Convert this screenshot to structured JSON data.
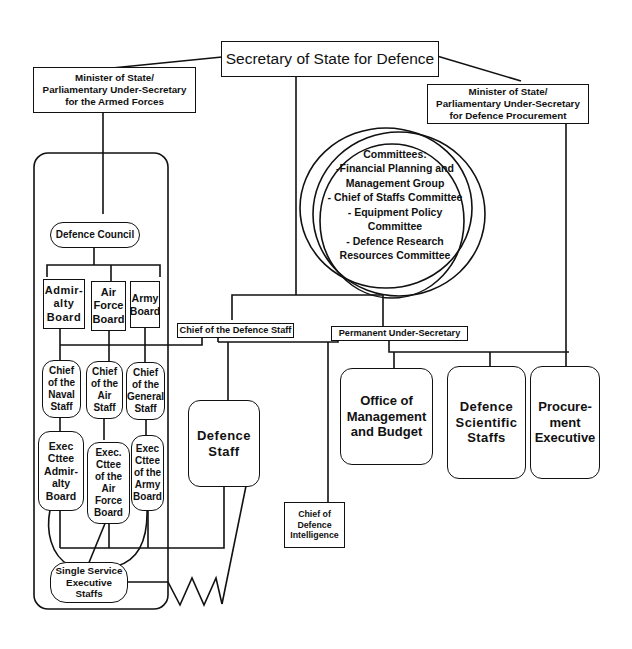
{
  "diagram": {
    "nodes": {
      "secretary": "Secretary of State for Defence",
      "minister_armed_forces": "Minister of State/\nParliamentary Under-Secretary\nfor the Armed Forces",
      "minister_procurement": "Minister of State/\nParliamentary Under-Secretary\nfor Defence Procurement",
      "committees": "Committees:\n-Financial Planning and\nManagement Group\n- Chief of Staffs  Committee\n- Equipment Policy Committee\n- Defence Research\nResources Committee",
      "defence_council": "Defence Council",
      "admiralty_board": "Admir-\nalty\nBoard",
      "air_force_board": "Air\nForce\nBoard",
      "army_board": "Army\nBoard",
      "chief_naval_staff": "Chief\nof the\nNaval\nStaff",
      "chief_air_staff": "Chief\nof the\nAir\nStaff",
      "chief_general_staff": "Chief\nof the\nGeneral\nStaff",
      "exec_admiralty": "Exec\nCttee\nAdmir-\nalty\nBoard",
      "exec_air_force": "Exec.\nCttee\nof the\nAir\nForce\nBoard",
      "exec_army": "Exec\nCttee\nof the\nArmy\nBoard",
      "single_service": "Single Service\nExecutive\nStaffs",
      "chief_defence_staff": "Chief of the Defence Staff",
      "permanent_under_secretary": "Permanent Under-Secretary",
      "defence_staff": "Defence\nStaff",
      "chief_defence_intelligence": "Chief of\nDefence\nIntelligence",
      "office_management_budget": "Office of\nManagement\nand Budget",
      "defence_scientific_staffs": "Defence\nScientific\nStaffs",
      "procurement_executive": "Procure-\nment\nExecutive"
    }
  }
}
